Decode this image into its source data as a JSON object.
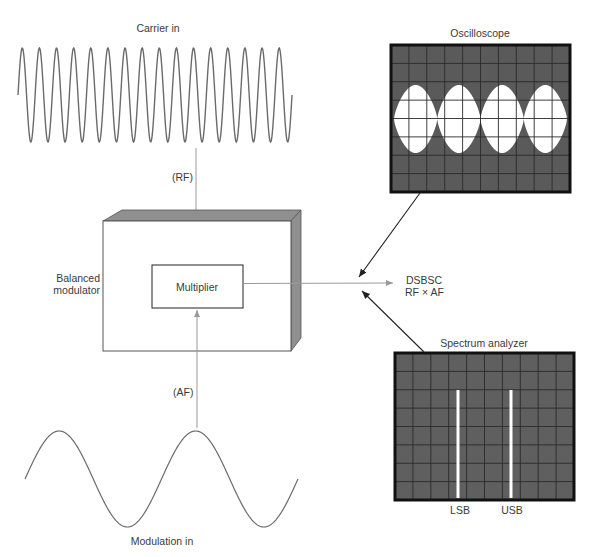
{
  "labels": {
    "carrier_in": "Carrier in",
    "rf": "(RF)",
    "af": "(AF)",
    "modulation_in": "Modulation in",
    "balanced_modulator_line1": "Balanced",
    "balanced_modulator_line2": "modulator",
    "multiplier": "Multiplier",
    "output_line1": "DSBSC",
    "output_line2": "RF × AF",
    "oscilloscope": "Oscilloscope",
    "spectrum_analyzer": "Spectrum analyzer",
    "lsb": "LSB",
    "usb": "USB"
  },
  "colors": {
    "wire": "#9a9a9a",
    "wave": "#6b6b6b",
    "screen_bg": "#5a5a5a",
    "screen_frame": "#111111",
    "grid": "#2a2a2a",
    "trace": "#ffffff",
    "box_shade": "#8f8f8f",
    "pointer": "#222222"
  },
  "carrier": {
    "cycles": 16,
    "x_start": 18,
    "x_end": 292,
    "center_y": 95,
    "amplitude": 47
  },
  "modulation": {
    "cycles": 2,
    "x_start": 25,
    "x_end": 298,
    "center_y": 479,
    "amplitude": 48
  },
  "oscilloscope": {
    "grid_cols": 10,
    "grid_rows": 8,
    "envelope_lobes": 4
  },
  "spectrum_analyzer": {
    "grid_cols": 10,
    "grid_rows": 8,
    "lines": [
      "LSB",
      "USB"
    ]
  }
}
